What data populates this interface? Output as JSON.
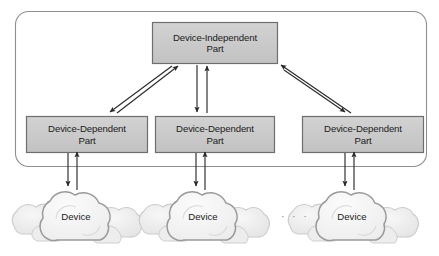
{
  "diagram": {
    "container": {
      "name": "system-boundary",
      "x": 15,
      "y": 11,
      "width": 412,
      "height": 156,
      "radius": 13,
      "stroke": "#8f8f8f",
      "fill": "none"
    },
    "colors": {
      "box_fill": "#c9c9c9",
      "box_stroke": "#6e6e6e",
      "box_text": "#1b1b1b",
      "arrow": "#2a2a2a",
      "boundary_stroke": "#8f8f8f",
      "cloud_front_stroke": "#9a9a9a",
      "cloud_front_fill": "#f2f2f2",
      "cloud_back_fill": "#ebebeb",
      "cloud_back_stroke": "#c3c3c3",
      "ellipsis_color": "#8d8d8d",
      "page_background": "#ffffff"
    },
    "boxes": [
      {
        "id": "device-independent-part",
        "label": "Device-Independent\nPart",
        "line1": "Device-Independent",
        "line2": "Part",
        "x": 152,
        "y": 22,
        "width": 126,
        "height": 42
      },
      {
        "id": "device-dependent-part-1",
        "label": "Device-Dependent\nPart",
        "line1": "Device-Dependent",
        "line2": "Part",
        "x": 26,
        "y": 116,
        "width": 122,
        "height": 37
      },
      {
        "id": "device-dependent-part-2",
        "label": "Device-Dependent\nPart",
        "line1": "Device-Dependent",
        "line2": "Part",
        "x": 155,
        "y": 116,
        "width": 120,
        "height": 37
      },
      {
        "id": "device-dependent-part-3",
        "label": "Device-Dependent\nPart",
        "line1": "Device-Dependent",
        "line2": "Part",
        "x": 302,
        "y": 116,
        "width": 122,
        "height": 37
      }
    ],
    "clouds": [
      {
        "id": "device-cloud-1",
        "label": "Device",
        "cx": 76,
        "cy": 214
      },
      {
        "id": "device-cloud-2",
        "label": "Device",
        "cx": 203,
        "cy": 214
      },
      {
        "id": "device-cloud-3",
        "label": "Device",
        "cx": 352,
        "cy": 214
      }
    ],
    "ellipsis": {
      "id": "clouds-ellipsis",
      "label": "· · ·",
      "x": 281,
      "y": 210
    },
    "arrows": [
      {
        "id": "indep-to-dep1",
        "from": "device-independent-part",
        "to": "device-dependent-part-1",
        "direction": "down-left",
        "x1": 171,
        "y1": 66,
        "x2": 110,
        "y2": 113
      },
      {
        "id": "dep1-to-indep",
        "from": "device-dependent-part-1",
        "to": "device-independent-part",
        "direction": "up-right",
        "x1": 116,
        "y1": 113,
        "x2": 177,
        "y2": 66
      },
      {
        "id": "indep-to-dep2",
        "from": "device-independent-part",
        "to": "device-dependent-part-2",
        "direction": "down",
        "x1": 197,
        "y1": 66,
        "x2": 197,
        "y2": 113
      },
      {
        "id": "dep2-to-indep",
        "from": "device-dependent-part-2",
        "to": "device-independent-part",
        "direction": "up",
        "x1": 207,
        "y1": 113,
        "x2": 207,
        "y2": 66
      },
      {
        "id": "indep-to-dep3",
        "from": "device-independent-part",
        "to": "device-dependent-part-3",
        "direction": "down-right",
        "x1": 281,
        "y1": 70,
        "x2": 344,
        "y2": 113
      },
      {
        "id": "dep3-to-indep",
        "from": "device-dependent-part-3",
        "to": "device-independent-part",
        "direction": "up-left",
        "x1": 350,
        "y1": 113,
        "x2": 278,
        "y2": 64
      },
      {
        "id": "dep1-to-device1",
        "from": "device-dependent-part-1",
        "to": "device-cloud-1",
        "direction": "down",
        "x1": 68,
        "y1": 153,
        "x2": 68,
        "y2": 184
      },
      {
        "id": "device1-to-dep1",
        "from": "device-cloud-1",
        "to": "device-dependent-part-1",
        "direction": "up",
        "x1": 77,
        "y1": 187,
        "x2": 77,
        "y2": 154
      },
      {
        "id": "dep2-to-device2",
        "from": "device-dependent-part-2",
        "to": "device-cloud-2",
        "direction": "down",
        "x1": 196,
        "y1": 153,
        "x2": 196,
        "y2": 184
      },
      {
        "id": "device2-to-dep2",
        "from": "device-cloud-2",
        "to": "device-dependent-part-2",
        "direction": "up",
        "x1": 205,
        "y1": 187,
        "x2": 205,
        "y2": 154
      },
      {
        "id": "dep3-to-device3",
        "from": "device-dependent-part-3",
        "to": "device-cloud-3",
        "direction": "down",
        "x1": 345,
        "y1": 153,
        "x2": 345,
        "y2": 184
      },
      {
        "id": "device3-to-dep3",
        "from": "device-cloud-3",
        "to": "device-dependent-part-3",
        "direction": "up",
        "x1": 354,
        "y1": 187,
        "x2": 354,
        "y2": 154
      }
    ]
  }
}
